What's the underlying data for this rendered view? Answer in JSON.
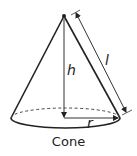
{
  "diagram": {
    "shape": "cone",
    "caption": "Cone",
    "labels": {
      "height": "h",
      "slant": "l",
      "radius": "r"
    },
    "colors": {
      "stroke": "#222222",
      "background": "#ffffff"
    }
  }
}
